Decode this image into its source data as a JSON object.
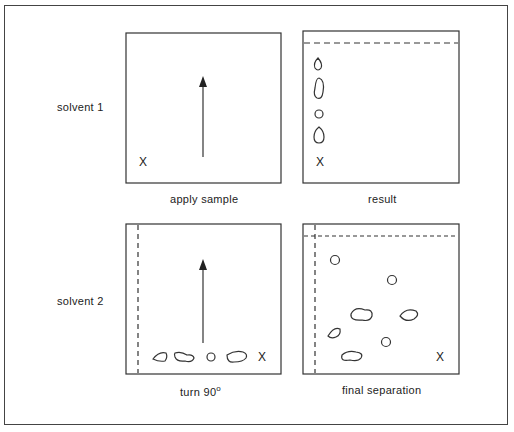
{
  "diagram": {
    "rows": [
      {
        "label": "solvent 1"
      },
      {
        "label": "solvent 2"
      }
    ],
    "panels": [
      {
        "id": "apply",
        "caption": "apply sample",
        "origin_mark": "X"
      },
      {
        "id": "result",
        "caption": "result",
        "origin_mark": "X"
      },
      {
        "id": "turn",
        "caption_text": "turn 90",
        "caption_sup": "o",
        "origin_mark": "X"
      },
      {
        "id": "final",
        "caption": "final separation",
        "origin_mark": "X"
      }
    ]
  }
}
